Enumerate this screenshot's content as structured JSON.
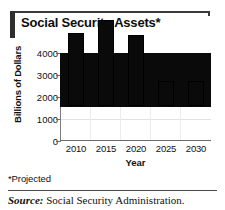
{
  "figure": {
    "title": "Social Security Assets*",
    "footnote": "*Projected",
    "source_label": "Source:",
    "source_text": "Social Security Administration."
  },
  "chart_data": {
    "type": "bar",
    "title": "Social Security Assets*",
    "xlabel": "Year",
    "ylabel": "Billions of Dollars",
    "categories": [
      "2010",
      "2015",
      "2020",
      "2025",
      "2030"
    ],
    "values": [
      2500,
      3350,
      3950,
      3280,
      1150
    ],
    "ylim": [
      0,
      4000
    ],
    "yticks": [
      "0",
      "1000",
      "2000",
      "3000",
      "4000"
    ],
    "ytick_values": [
      0,
      1000,
      2000,
      3000,
      4000
    ],
    "grid": true,
    "legend": "none",
    "bar_color": "#0a0a0a",
    "annotations": [
      "*Projected"
    ]
  }
}
